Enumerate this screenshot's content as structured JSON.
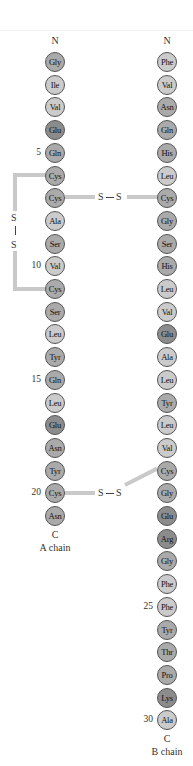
{
  "diagram": {
    "colors": {
      "hydrophobic": "#cbcbcb",
      "polar": "#aaaaaa",
      "charged": "#8c8c8c",
      "bond": "#c9c9c9"
    },
    "chain_a": {
      "n_label": "N",
      "c_label": "C",
      "name": "A chain",
      "residues": [
        "Gly",
        "Ile",
        "Val",
        "Glu",
        "Gln",
        "Cys",
        "Cys",
        "Ala",
        "Ser",
        "Val",
        "Cys",
        "Ser",
        "Leu",
        "Tyr",
        "Gln",
        "Leu",
        "Glu",
        "Asn",
        "Tyr",
        "Cys",
        "Asn"
      ],
      "position_markers": [
        {
          "index": 5,
          "label": "5"
        },
        {
          "index": 10,
          "label": "10"
        },
        {
          "index": 15,
          "label": "15"
        },
        {
          "index": 20,
          "label": "20"
        }
      ]
    },
    "chain_b": {
      "n_label": "N",
      "c_label": "C",
      "name": "B chain",
      "residues": [
        "Phe",
        "Val",
        "Asn",
        "Gln",
        "His",
        "Leu",
        "Cys",
        "Gly",
        "Ser",
        "His",
        "Leu",
        "Val",
        "Glu",
        "Ala",
        "Leu",
        "Tyr",
        "Leu",
        "Val",
        "Cys",
        "Gly",
        "Glu",
        "Arg",
        "Gly",
        "Phe",
        "Phe",
        "Tyr",
        "Thr",
        "Pro",
        "Lys",
        "Ala"
      ],
      "position_markers": [
        {
          "index": 25,
          "label": "25"
        },
        {
          "index": 30,
          "label": "30"
        }
      ]
    },
    "disulfide_bonds": [
      {
        "from": "A6",
        "to": "A11",
        "label_top": "S",
        "label_bottom": "S",
        "type": "intrachain"
      },
      {
        "from": "A7",
        "to": "B7",
        "label_left": "S",
        "label_right": "S",
        "type": "interchain"
      },
      {
        "from": "A20",
        "to": "B19",
        "label_left": "S",
        "label_right": "S",
        "type": "interchain"
      }
    ]
  }
}
